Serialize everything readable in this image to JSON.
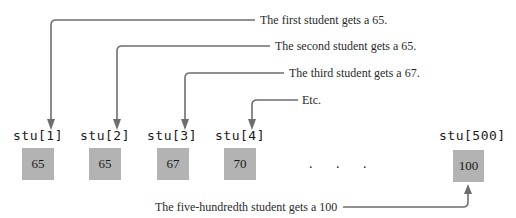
{
  "diagram": {
    "annotations": [
      {
        "text": "The first student gets a 65.",
        "target": "stu[1]"
      },
      {
        "text": "The second student gets a 65.",
        "target": "stu[2]"
      },
      {
        "text": "The third student gets a 67.",
        "target": "stu[3]"
      },
      {
        "text": "Etc.",
        "target": "stu[4]"
      }
    ],
    "cells": [
      {
        "label": "stu[1]",
        "value": "65"
      },
      {
        "label": "stu[2]",
        "value": "65"
      },
      {
        "label": "stu[3]",
        "value": "67"
      },
      {
        "label": "stu[4]",
        "value": "70"
      },
      {
        "label": "stu[500]",
        "value": "100"
      }
    ],
    "ellipsis": ". . .",
    "bottom_annotation": {
      "text": "The five-hundredth student gets a 100",
      "target": "stu[500]"
    },
    "colors": {
      "cell_fill": "#b3b3b3",
      "arrow": "#6e6e6e",
      "text": "#2a2a2a"
    }
  }
}
